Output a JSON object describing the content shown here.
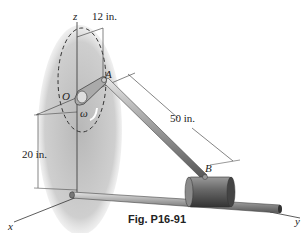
{
  "figure": {
    "caption": "Fig. P16-91",
    "axes": {
      "x": "x",
      "y": "y",
      "z": "z"
    },
    "points": {
      "O": "O",
      "A": "A",
      "B": "B"
    },
    "angular_velocity_symbol": "ω",
    "dimensions": {
      "crank_radius": "12 in.",
      "rod_length": "50 in.",
      "height": "20 in."
    },
    "colors": {
      "disk_fill": "#c8c8c8",
      "rod": "#8a8a8a",
      "collar": "#6e6e6e",
      "line": "#333333"
    }
  }
}
